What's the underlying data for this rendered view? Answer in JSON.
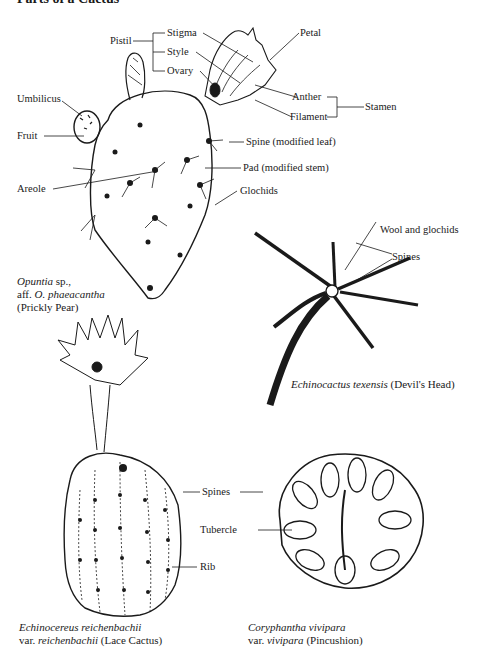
{
  "title": "Parts of a Cactus",
  "labels": {
    "pistil": "Pistil",
    "stigma": "Stigma",
    "style": "Style",
    "ovary": "Ovary",
    "petal": "Petal",
    "anther": "Anther",
    "filament": "Filament",
    "stamen": "Stamen",
    "umbilicus": "Umbilicus",
    "fruit": "Fruit",
    "spine": "Spine (modified leaf)",
    "pad": "Pad (modified stem)",
    "areole": "Areole",
    "glochids": "Glochids",
    "wool": "Wool and glochids",
    "spines_devil": "Spines",
    "spines_lace": "Spines",
    "tubercle": "Tubercle",
    "rib": "Rib"
  },
  "captions": {
    "opuntia": {
      "line1_italic": "Opuntia",
      "line1_rest": " sp.,",
      "line2_pre": "aff. ",
      "line2_italic": "O. phaeacantha",
      "line3": "(Prickly Pear)"
    },
    "devils_head": {
      "italic": "Echinocactus texensis",
      "rest": " (Devil's Head)"
    },
    "lace": {
      "line1_italic": "Echinocereus reichenbachii",
      "line2_pre": "var. ",
      "line2_italic": "reichenbachii",
      "line2_rest": " (Lace Cactus)"
    },
    "pincushion": {
      "line1_italic": "Coryphantha vivipara",
      "line2_pre": "var. ",
      "line2_italic": "vivipara",
      "line2_rest": " (Pincushion)"
    }
  },
  "colors": {
    "ink": "#1a1a1a",
    "background": "#ffffff"
  }
}
